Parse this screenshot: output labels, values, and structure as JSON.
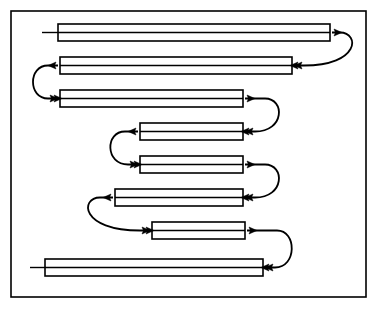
{
  "figure": {
    "type": "flow-diagram",
    "name": "serpentine-bar-flow-diagram",
    "background_color": "#ffffff",
    "stroke_color": "#000000",
    "fill_color": "#ffffff",
    "border": {
      "name": "outer-frame",
      "x": 11,
      "y": 11,
      "width": 355,
      "height": 286,
      "stroke_width": 1.6
    },
    "bar_style": {
      "height": 17,
      "stroke_width": 1.6,
      "center_line_width": 1.4
    },
    "connector_style": {
      "stroke_width": 1.8,
      "arrow_head_length": 8,
      "arrow_head_width": 7
    },
    "bars": [
      {
        "id": 1,
        "name": "bar-1",
        "x1": 58,
        "x2": 330,
        "y": 24,
        "length": 272,
        "lead_in_tail": true,
        "lead_in_x": 42,
        "entry_side": "left",
        "exit_side": "right"
      },
      {
        "id": 2,
        "name": "bar-2",
        "x1": 60,
        "x2": 292,
        "y": 57,
        "length": 232,
        "lead_in_tail": false,
        "entry_side": "right",
        "exit_side": "left"
      },
      {
        "id": 3,
        "name": "bar-3",
        "x1": 60,
        "x2": 243,
        "y": 90,
        "length": 183,
        "lead_in_tail": false,
        "entry_side": "left",
        "exit_side": "right"
      },
      {
        "id": 4,
        "name": "bar-4",
        "x1": 140,
        "x2": 243,
        "y": 123,
        "length": 103,
        "lead_in_tail": false,
        "entry_side": "right",
        "exit_side": "left"
      },
      {
        "id": 5,
        "name": "bar-5",
        "x1": 140,
        "x2": 243,
        "y": 156,
        "length": 103,
        "lead_in_tail": false,
        "entry_side": "left",
        "exit_side": "right"
      },
      {
        "id": 6,
        "name": "bar-6",
        "x1": 115,
        "x2": 243,
        "y": 189,
        "length": 128,
        "lead_in_tail": false,
        "entry_side": "right",
        "exit_side": "left"
      },
      {
        "id": 7,
        "name": "bar-7",
        "x1": 152,
        "x2": 245,
        "y": 222,
        "length": 93,
        "lead_in_tail": false,
        "entry_side": "left",
        "exit_side": "right"
      },
      {
        "id": 8,
        "name": "bar-8",
        "x1": 45,
        "x2": 263,
        "y": 259,
        "length": 218,
        "lead_in_tail": true,
        "lead_in_x": 30,
        "entry_side": "right",
        "exit_side": "none"
      }
    ],
    "connectors": [
      {
        "id": 1,
        "name": "connector-1-right",
        "from_bar": 1,
        "to_bar": 2,
        "side": "right",
        "loop_extent_x": 352,
        "from_y": 32.5,
        "to_y": 65.5
      },
      {
        "id": 2,
        "name": "connector-2-left",
        "from_bar": 2,
        "to_bar": 3,
        "side": "left",
        "loop_extent_x": 36,
        "from_y": 65.5,
        "to_y": 98.5
      },
      {
        "id": 3,
        "name": "connector-3-right",
        "from_bar": 3,
        "to_bar": 4,
        "side": "right",
        "loop_extent_x": 277,
        "from_y": 98.5,
        "to_y": 131.5
      },
      {
        "id": 4,
        "name": "connector-4-left",
        "from_bar": 4,
        "to_bar": 5,
        "side": "left",
        "loop_extent_x": 113,
        "from_y": 131.5,
        "to_y": 164.5
      },
      {
        "id": 5,
        "name": "connector-5-right",
        "from_bar": 5,
        "to_bar": 6,
        "side": "right",
        "loop_extent_x": 277,
        "from_y": 164.5,
        "to_y": 197.5
      },
      {
        "id": 6,
        "name": "connector-6-left",
        "from_bar": 6,
        "to_bar": 7,
        "side": "left",
        "loop_extent_x": 88,
        "from_y": 197.5,
        "to_y": 230.5
      },
      {
        "id": 7,
        "name": "connector-7-right",
        "from_bar": 7,
        "to_bar": 8,
        "side": "right",
        "loop_extent_x": 289,
        "from_y": 230.5,
        "to_y": 267.5
      }
    ]
  }
}
